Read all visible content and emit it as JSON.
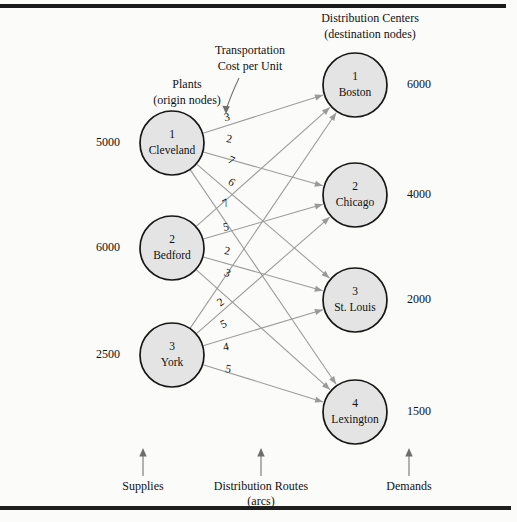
{
  "diagram": {
    "title_left": {
      "line1": "Plants",
      "line2": "(origin nodes)"
    },
    "title_right": {
      "line1": "Distribution Centers",
      "line2": "(destination nodes)"
    },
    "annotation": {
      "line1": "Transportation",
      "line2": "Cost per Unit"
    },
    "footer": {
      "left": "Supplies",
      "center_line1": "Distribution Routes",
      "center_line2": "(arcs)",
      "right": "Demands"
    },
    "colors": {
      "node_fill": "#e4e4e4",
      "node_stroke": "#171717",
      "arc": "#9a9a9a",
      "background": "#fbfbfa",
      "text": "#111111"
    }
  },
  "chart_data": {
    "type": "diagram",
    "origin_nodes": [
      {
        "index": "1",
        "name": "Cleveland",
        "supply": "5000",
        "cx": 172,
        "cy": 143,
        "r": 32
      },
      {
        "index": "2",
        "name": "Bedford",
        "supply": "6000",
        "cx": 172,
        "cy": 248,
        "r": 32
      },
      {
        "index": "3",
        "name": "York",
        "supply": "2500",
        "cx": 172,
        "cy": 355,
        "r": 32
      }
    ],
    "destination_nodes": [
      {
        "index": "1",
        "name": "Boston",
        "demand": "6000",
        "cx": 355,
        "cy": 85,
        "r": 32
      },
      {
        "index": "2",
        "name": "Chicago",
        "demand": "4000",
        "cx": 355,
        "cy": 195,
        "r": 32
      },
      {
        "index": "3",
        "name": "St. Louis",
        "demand": "2000",
        "cx": 355,
        "cy": 300,
        "r": 32
      },
      {
        "index": "4",
        "name": "Lexington",
        "demand": "1500",
        "cx": 355,
        "cy": 412,
        "r": 32
      }
    ],
    "arcs": [
      {
        "from": "Cleveland",
        "to": "Boston",
        "cost": "3",
        "lx": 227,
        "ly": 118
      },
      {
        "from": "Cleveland",
        "to": "Chicago",
        "cost": "2",
        "lx": 229,
        "ly": 140
      },
      {
        "from": "Cleveland",
        "to": "St. Louis",
        "cost": "7",
        "lx": 231,
        "ly": 161
      },
      {
        "from": "Cleveland",
        "to": "Lexington",
        "cost": "6",
        "lx": 231,
        "ly": 183
      },
      {
        "from": "Bedford",
        "to": "Boston",
        "cost": "7",
        "lx": 226,
        "ly": 204
      },
      {
        "from": "Bedford",
        "to": "Chicago",
        "cost": "5",
        "lx": 226,
        "ly": 228
      },
      {
        "from": "Bedford",
        "to": "St. Louis",
        "cost": "2",
        "lx": 227,
        "ly": 252
      },
      {
        "from": "Bedford",
        "to": "Lexington",
        "cost": "3",
        "lx": 227,
        "ly": 274
      },
      {
        "from": "York",
        "to": "Boston",
        "cost": "2",
        "lx": 221,
        "ly": 303
      },
      {
        "from": "York",
        "to": "Chicago",
        "cost": "5",
        "lx": 224,
        "ly": 325
      },
      {
        "from": "York",
        "to": "St. Louis",
        "cost": "4",
        "lx": 226,
        "ly": 348
      },
      {
        "from": "York",
        "to": "Lexington",
        "cost": "5",
        "lx": 228,
        "ly": 370
      }
    ],
    "supply_values": [
      "5000",
      "6000",
      "2500"
    ],
    "demand_values": [
      "6000",
      "4000",
      "2000",
      "1500"
    ]
  }
}
